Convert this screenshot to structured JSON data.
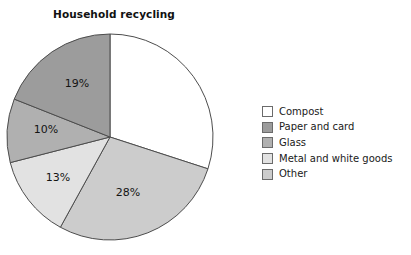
{
  "chart_data": {
    "type": "pie",
    "title": "Household recycling",
    "xlabel": "",
    "ylabel": "",
    "legend_position": "right",
    "grid": false,
    "units": "percent",
    "start_angle_deg": 0,
    "direction": "clockwise",
    "categories": [
      "Compost",
      "Other",
      "Metal and white goods",
      "Glass",
      "Paper and card"
    ],
    "values": [
      30,
      28,
      13,
      10,
      19
    ],
    "slices": [
      {
        "label": "Compost",
        "value": 30,
        "display_value": "",
        "show_label": false,
        "color": "#ffffff",
        "start_deg": 0,
        "end_deg": 108
      },
      {
        "label": "Other",
        "value": 28,
        "display_value": "28%",
        "show_label": true,
        "color": "#cccccc",
        "start_deg": 108,
        "end_deg": 208.8,
        "label_x": 128,
        "label_y": 167
      },
      {
        "label": "Metal and white goods",
        "value": 13,
        "display_value": "13%",
        "show_label": true,
        "color": "#e2e2e2",
        "start_deg": 208.8,
        "end_deg": 255.6,
        "label_x": 58,
        "label_y": 152
      },
      {
        "label": "Glass",
        "value": 10,
        "display_value": "10%",
        "show_label": true,
        "color": "#b0b0b0",
        "start_deg": 255.6,
        "end_deg": 291.6,
        "label_x": 46,
        "label_y": 104
      },
      {
        "label": "Paper and card",
        "value": 19,
        "display_value": "19%",
        "show_label": true,
        "color": "#9c9c9c",
        "start_deg": 291.6,
        "end_deg": 360,
        "label_x": 77,
        "label_y": 58
      }
    ]
  },
  "legend": {
    "items": [
      {
        "label": "Compost",
        "color": "#ffffff"
      },
      {
        "label": "Paper and card",
        "color": "#9c9c9c"
      },
      {
        "label": "Glass",
        "color": "#b0b0b0"
      },
      {
        "label": "Metal and white goods",
        "color": "#e2e2e2"
      },
      {
        "label": "Other",
        "color": "#cccccc"
      }
    ]
  },
  "style": {
    "background": "#ffffff",
    "slice_outline": "#4d4d4d",
    "text_color": "#1a1a1a"
  }
}
